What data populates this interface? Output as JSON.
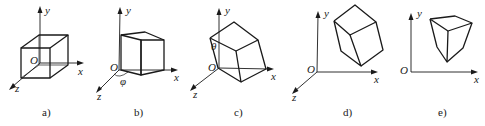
{
  "figure": {
    "panels": [
      {
        "id": "a",
        "caption": "a)",
        "axis_labels": {
          "y": "y",
          "x": "x",
          "z": "z",
          "origin": "O"
        },
        "description": "Cube aligned with axes, origin at cube center"
      },
      {
        "id": "b",
        "caption": "b)",
        "axis_labels": {
          "y": "y",
          "x": "x",
          "z": "z",
          "origin": "O"
        },
        "angle_label": "φ",
        "description": "Cube rotated by angle phi about y-axis, corner at origin"
      },
      {
        "id": "c",
        "caption": "c)",
        "axis_labels": {
          "y": "y",
          "x": "x",
          "z": "z",
          "origin": "O"
        },
        "angle_label": "θ",
        "description": "Cube further tilted by angle theta"
      },
      {
        "id": "d",
        "caption": "d)",
        "axis_labels": {
          "y": "y",
          "x": "x",
          "z": "z",
          "origin": "O"
        },
        "description": "Cube translated away from origin"
      },
      {
        "id": "e",
        "caption": "e)",
        "axis_labels": {
          "y": "y",
          "x": "x",
          "origin": "O"
        },
        "description": "Perspective projection of cube onto xy plane"
      }
    ]
  }
}
